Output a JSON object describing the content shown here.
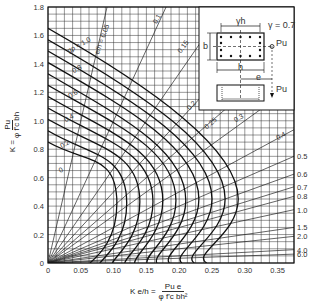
{
  "chart_data": {
    "type": "line",
    "title": "",
    "xlabel": "K e/h = Pu e / (φ f'c b h²)",
    "ylabel": "K = Pu / (φ f'c b h)",
    "xlim": [
      0,
      0.375
    ],
    "ylim": [
      0,
      1.8
    ],
    "grid": true,
    "x_ticks": [
      "0",
      "0.05",
      "0.10",
      "0.15",
      "0.20",
      "0.25",
      "0.30",
      "0.35"
    ],
    "y_ticks": [
      "0",
      "0.2",
      "0.4",
      "0.6",
      "0.8",
      "1.0",
      "1.2",
      "1.4",
      "1.6",
      "1.8"
    ],
    "gamma": "γ = 0.7",
    "interaction_curves": {
      "parameter": "gρ",
      "labeled": [
        "0",
        "0.2",
        "0.4",
        "0.6",
        "0.8",
        "1.0"
      ],
      "series": [
        {
          "name": "gρ=0",
          "y_axis": 0.85,
          "nose_x": 0.105,
          "nose_y": 0.42
        },
        {
          "name": "gρ=0.1",
          "y_axis": 0.93,
          "nose_x": 0.12,
          "nose_y": 0.42
        },
        {
          "name": "gρ=0.2",
          "y_axis": 1.01,
          "nose_x": 0.14,
          "nose_y": 0.43
        },
        {
          "name": "gρ=0.3",
          "y_axis": 1.09,
          "nose_x": 0.16,
          "nose_y": 0.43
        },
        {
          "name": "gρ=0.4",
          "y_axis": 1.17,
          "nose_x": 0.175,
          "nose_y": 0.44
        },
        {
          "name": "gρ=0.5",
          "y_axis": 1.25,
          "nose_x": 0.195,
          "nose_y": 0.44
        },
        {
          "name": "gρ=0.6",
          "y_axis": 1.33,
          "nose_x": 0.21,
          "nose_y": 0.44
        },
        {
          "name": "gρ=0.7",
          "y_axis": 1.41,
          "nose_x": 0.23,
          "nose_y": 0.45
        },
        {
          "name": "gρ=0.8",
          "y_axis": 1.49,
          "nose_x": 0.25,
          "nose_y": 0.45
        },
        {
          "name": "gρ=0.9",
          "y_axis": 1.57,
          "nose_x": 0.27,
          "nose_y": 0.45
        },
        {
          "name": "gρ=1.0",
          "y_axis": 1.65,
          "nose_x": 0.29,
          "nose_y": 0.45
        }
      ]
    },
    "eccentricity_lines": {
      "parameter": "e/h",
      "top_labels": [
        "0.05",
        "0.1",
        "0.15",
        "0.2",
        "0.25",
        "0.3",
        "0.4"
      ],
      "right_labels": [
        "0.5",
        "0.6",
        "0.7",
        "0.8",
        "1.0",
        "1.5",
        "2.0",
        "4.0",
        "6.0"
      ],
      "values": [
        0.05,
        0.1,
        0.15,
        0.2,
        0.25,
        0.3,
        0.4,
        0.5,
        0.6,
        0.7,
        0.8,
        1.0,
        1.5,
        2.0,
        4.0,
        6.0
      ]
    }
  },
  "labels": {
    "y_axis_k": "K =",
    "y_axis_num": "Pu",
    "y_axis_den": "φ f'c bh",
    "x_axis_k": "K e/h =",
    "x_axis_num": "Pu e",
    "x_axis_den": "φ f'c bh²",
    "curve_label_prefix": "gρ = 1.0",
    "eh_label_prefix": "e/h = 0.05",
    "inset": {
      "gamma_h": "γh",
      "gamma_value": "γ = 0.7",
      "b": "b",
      "h": "h",
      "e": "e",
      "pu_top": "Pu",
      "pu_side": "Pu"
    }
  }
}
